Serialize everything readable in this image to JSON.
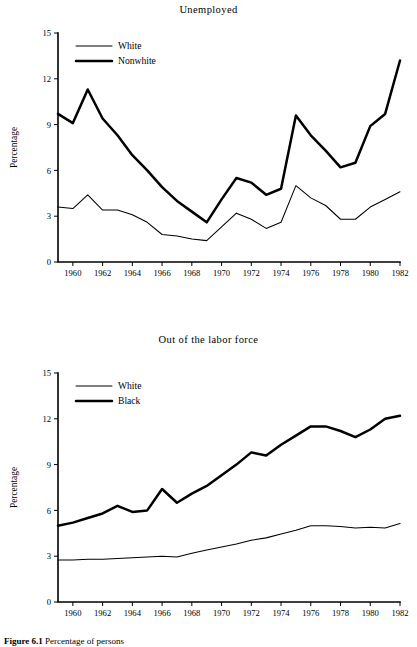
{
  "page": {
    "background": "#ffffff",
    "ink": "#000000"
  },
  "caption": {
    "number": "Figure 6.1",
    "text": "Percentage of persons"
  },
  "chart_data": [
    {
      "id": "unemployed",
      "type": "line",
      "title": "Unemployed",
      "xlabel": "",
      "ylabel": "Percentage",
      "ylim": [
        0,
        15
      ],
      "xlim": [
        1959,
        1982
      ],
      "yticks": [
        0,
        3,
        6,
        9,
        12,
        15
      ],
      "ytick_labels": [
        "0",
        "3",
        "6",
        "9",
        "12",
        "15"
      ],
      "xticks": [
        1960,
        1962,
        1964,
        1966,
        1968,
        1970,
        1972,
        1974,
        1976,
        1978,
        1980,
        1982
      ],
      "xtick_labels": [
        "1960",
        "1962",
        "1964",
        "1966",
        "1968",
        "1970",
        "1972",
        "1974",
        "1976",
        "1978",
        "1980",
        "1982"
      ],
      "grid": false,
      "legend_position": "top-left",
      "x": [
        1959,
        1960,
        1961,
        1962,
        1963,
        1964,
        1965,
        1966,
        1967,
        1968,
        1969,
        1970,
        1971,
        1972,
        1973,
        1974,
        1975,
        1976,
        1977,
        1978,
        1979,
        1980,
        1981,
        1982
      ],
      "series": [
        {
          "name": "White",
          "style": "thin",
          "values": [
            3.6,
            3.5,
            4.4,
            3.4,
            3.4,
            3.1,
            2.6,
            1.8,
            1.7,
            1.5,
            1.4,
            2.3,
            3.2,
            2.8,
            2.2,
            2.6,
            5.0,
            4.2,
            3.7,
            2.8,
            2.8,
            3.6,
            4.1,
            4.6,
            6.7
          ]
        },
        {
          "name": "Nonwhite",
          "style": "thick",
          "values": [
            9.7,
            9.1,
            11.3,
            9.4,
            8.3,
            7.0,
            6.0,
            4.9,
            4.0,
            3.3,
            2.6,
            4.1,
            5.5,
            5.2,
            4.4,
            4.8,
            9.6,
            8.3,
            7.3,
            6.2,
            6.5,
            8.9,
            9.7,
            13.2
          ]
        }
      ]
    },
    {
      "id": "out-of-labor-force",
      "type": "line",
      "title": "Out of the labor force",
      "xlabel": "",
      "ylabel": "Percentage",
      "ylim": [
        0,
        15
      ],
      "xlim": [
        1959,
        1982
      ],
      "yticks": [
        0,
        3,
        6,
        9,
        12,
        15
      ],
      "ytick_labels": [
        "0",
        "3",
        "6",
        "9",
        "12",
        "15"
      ],
      "xticks": [
        1960,
        1962,
        1964,
        1966,
        1968,
        1970,
        1972,
        1974,
        1976,
        1978,
        1980,
        1982
      ],
      "xtick_labels": [
        "1960",
        "1962",
        "1964",
        "1966",
        "1968",
        "1970",
        "1972",
        "1974",
        "1976",
        "1978",
        "1980",
        "1982"
      ],
      "grid": false,
      "legend_position": "top-left",
      "x": [
        1959,
        1960,
        1961,
        1962,
        1963,
        1964,
        1965,
        1966,
        1967,
        1968,
        1969,
        1970,
        1971,
        1972,
        1973,
        1974,
        1975,
        1976,
        1977,
        1978,
        1979,
        1980,
        1981,
        1982
      ],
      "series": [
        {
          "name": "White",
          "style": "thin",
          "values": [
            2.75,
            2.75,
            2.8,
            2.8,
            2.85,
            2.9,
            2.95,
            3.0,
            2.95,
            3.2,
            3.4,
            3.6,
            3.8,
            4.05,
            4.2,
            4.45,
            4.7,
            5.0,
            5.0,
            4.95,
            4.85,
            4.9,
            4.85,
            5.15
          ]
        },
        {
          "name": "Black",
          "style": "thick",
          "values": [
            5.0,
            5.2,
            5.5,
            5.8,
            6.3,
            5.9,
            6.0,
            7.4,
            6.5,
            7.1,
            7.6,
            8.3,
            9.0,
            9.8,
            9.6,
            10.3,
            10.9,
            11.5,
            11.5,
            11.2,
            10.8,
            11.3,
            12.0,
            12.2
          ]
        }
      ]
    }
  ]
}
